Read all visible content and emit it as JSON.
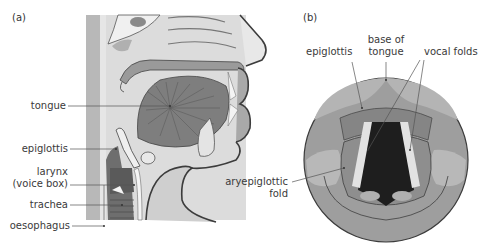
{
  "panels": {
    "a": {
      "label": "(a)",
      "title_hidden": "Sagittal section of head and neck",
      "labels": {
        "tongue": "tongue",
        "epiglottis": "epiglottis",
        "larynx_line1": "larynx",
        "larynx_line2": "(voice box)",
        "trachea": "trachea",
        "oesophagus": "oesophagus"
      }
    },
    "b": {
      "label": "(b)",
      "labels": {
        "epiglottis": "epiglottis",
        "base_of_tongue_line1": "base of",
        "base_of_tongue_line2": "tongue",
        "vocal_folds": "vocal folds",
        "aryepiglottic_line1": "aryepiglottic",
        "aryepiglottic_line2": "fold"
      }
    }
  },
  "colors": {
    "background": "#ffffff",
    "tissue_light": "#d4d4d4",
    "tissue_mid": "#a8a8a8",
    "tissue_dark": "#7a7a7a",
    "outline": "#3c3c3c",
    "airway_dark": "#1e1e1e",
    "leader_line": "#555555",
    "text": "#3a3a3a"
  }
}
